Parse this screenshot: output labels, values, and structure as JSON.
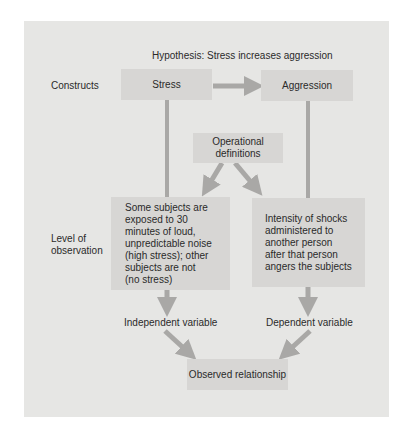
{
  "diagram": {
    "hypothesis": "Hypothesis:  Stress increases aggression",
    "row_labels": {
      "constructs": "Constructs",
      "level_of_observation_line1": "Level of",
      "level_of_observation_line2": "observation"
    },
    "constructs": {
      "left": "Stress",
      "right": "Aggression"
    },
    "operational_definitions": {
      "line1": "Operational",
      "line2": "definitions"
    },
    "independent_definition": [
      "Some subjects are",
      "exposed to 30",
      "minutes of loud,",
      "unpredictable noise",
      "(high stress); other",
      "subjects are not",
      "(no stress)"
    ],
    "dependent_definition": [
      "Intensity of shocks",
      "administered to",
      "another person",
      "after that person",
      "angers the subjects"
    ],
    "variables": {
      "independent": "Independent variable",
      "dependent": "Dependent variable"
    },
    "outcome": "Observed relationship",
    "colors": {
      "panel": "#e6e6e4",
      "box": "#d7d6d4",
      "arrow": "#a9a8a6",
      "text": "#2a2a2a"
    }
  }
}
